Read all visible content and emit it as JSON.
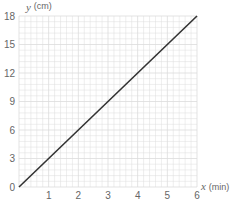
{
  "chart_data": {
    "type": "line",
    "title": "",
    "xlabel": "x (min)",
    "ylabel": "y (cm)",
    "x_axis_var": "x",
    "x_axis_unit": "(min)",
    "y_axis_var": "y",
    "y_axis_unit": "(cm)",
    "xlim": [
      0,
      6
    ],
    "ylim": [
      0,
      18
    ],
    "x_ticks": [
      1,
      2,
      3,
      4,
      5,
      6
    ],
    "y_ticks": [
      0,
      3,
      6,
      9,
      12,
      15,
      18
    ],
    "grid": true,
    "legend": null,
    "series": [
      {
        "name": "y = 3x",
        "x": [
          0,
          6
        ],
        "y": [
          0,
          18
        ],
        "color": "#333333"
      }
    ]
  },
  "colors": {
    "grid": "#dcdcdc",
    "line": "#333333",
    "axis_text": "#666666"
  }
}
